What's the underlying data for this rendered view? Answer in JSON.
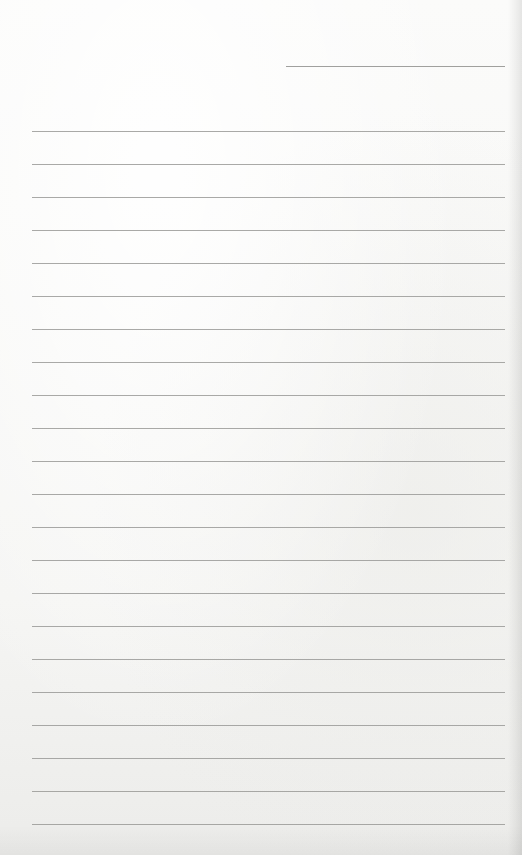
{
  "paper": {
    "type": "lined notebook page",
    "background_color": "#f6f6f4",
    "line_color": "#9a9a98",
    "header_line": {
      "x_start": 286,
      "x_end": 505,
      "y": 66
    },
    "ruled_lines": {
      "count": 22,
      "x_start": 32,
      "x_end": 505,
      "first_y": 131,
      "spacing": 33
    },
    "text_content": ""
  }
}
